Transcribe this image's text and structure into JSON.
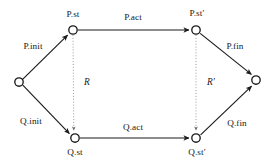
{
  "diagram": {
    "type": "commutative-refinement-diagram",
    "canvas": {
      "width": 276,
      "height": 168,
      "background": "#ffffff"
    },
    "colors": {
      "node_stroke": "#1a1a1a",
      "node_fill": "#ffffff",
      "edge_solid": "#1a1a1a",
      "edge_dotted": "#9a9a9a",
      "text": "#171717"
    },
    "nodes": [
      {
        "id": "start",
        "label": "",
        "x": 19,
        "y": 82,
        "r": 4.2,
        "label_x": 0,
        "label_y": 0
      },
      {
        "id": "p_st",
        "label": "P.st",
        "x": 73,
        "y": 30,
        "r": 4.2,
        "label_x": 73,
        "label_y": 15
      },
      {
        "id": "p_stp",
        "label": "P.st′",
        "x": 196,
        "y": 30,
        "r": 4.2,
        "label_x": 197,
        "label_y": 14
      },
      {
        "id": "q_st",
        "label": "Q.st",
        "x": 75,
        "y": 138,
        "r": 4.2,
        "label_x": 75,
        "label_y": 153
      },
      {
        "id": "q_stp",
        "label": "Q.st′",
        "x": 196,
        "y": 138,
        "r": 4.2,
        "label_x": 197,
        "label_y": 153
      },
      {
        "id": "end",
        "label": "",
        "x": 256,
        "y": 80,
        "r": 4.2,
        "label_x": 0,
        "label_y": 0
      }
    ],
    "edges": [
      {
        "id": "p_init",
        "label": "P.init",
        "from": "start",
        "to": "p_st",
        "style": "solid",
        "label_x": 33,
        "label_y": 47
      },
      {
        "id": "p_act",
        "label": "P.act",
        "from": "p_st",
        "to": "p_stp",
        "style": "solid",
        "label_x": 133,
        "label_y": 18
      },
      {
        "id": "p_fin",
        "label": "P.fin",
        "from": "p_stp",
        "to": "end",
        "style": "solid",
        "label_x": 235,
        "label_y": 47
      },
      {
        "id": "q_init",
        "label": "Q.init",
        "from": "start",
        "to": "q_st",
        "style": "solid",
        "label_x": 31,
        "label_y": 122
      },
      {
        "id": "q_act",
        "label": "Q.act",
        "from": "q_st",
        "to": "q_stp",
        "style": "solid",
        "label_x": 133,
        "label_y": 128
      },
      {
        "id": "q_fin",
        "label": "Q.fin",
        "from": "q_stp",
        "to": "end",
        "style": "solid",
        "label_x": 237,
        "label_y": 124
      },
      {
        "id": "r",
        "label": "R",
        "from": "p_st",
        "to": "q_st",
        "style": "dotted",
        "label_x": 87,
        "label_y": 83,
        "italic": true
      },
      {
        "id": "r_prime",
        "label": "R′",
        "from": "p_stp",
        "to": "q_stp",
        "style": "dotted",
        "label_x": 211,
        "label_y": 83,
        "italic": true
      }
    ]
  }
}
